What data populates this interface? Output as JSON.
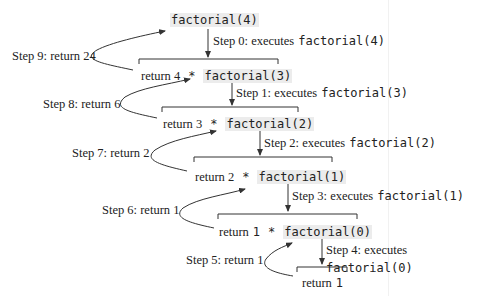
{
  "diagram": {
    "top_call": "factorial(4)",
    "levels": [
      {
        "prefix": "return 4",
        "op": "*",
        "call": "factorial(3)",
        "step_exec": "Step 0: executes",
        "step_exec_code": "factorial(4)",
        "step_return": "Step 9: return 24"
      },
      {
        "prefix": "return 3",
        "op": "*",
        "call": "factorial(2)",
        "step_exec": "Step 1: executes",
        "step_exec_code": "factorial(3)",
        "step_return": "Step 8: return 6"
      },
      {
        "prefix": "return 2",
        "op": "*",
        "call": "factorial(1)",
        "step_exec": "Step 2: executes",
        "step_exec_code": "factorial(2)",
        "step_return": "Step 7: return 2"
      },
      {
        "prefix": "return",
        "prefix_num": "1",
        "op": "*",
        "call": "factorial(0)",
        "step_exec": "Step 3: executes",
        "step_exec_code": "factorial(1)",
        "step_return": "Step 6: return 1"
      },
      {
        "prefix": "return",
        "prefix_num": "1",
        "step_exec": "Step 4: executes",
        "step_exec_code": "factorial(0)",
        "step_return": "Step 5: return 1"
      }
    ],
    "colors": {
      "line": "#333333",
      "code_bg": "#ececec",
      "text": "#222222"
    }
  }
}
